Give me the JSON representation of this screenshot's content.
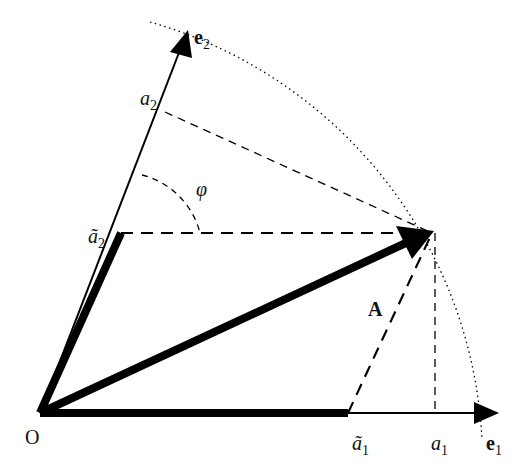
{
  "diagram": {
    "origin_label": "O",
    "vector_label": "A",
    "basis": {
      "e1": {
        "label": "e",
        "sub": "1"
      },
      "e2": {
        "label": "e",
        "sub": "2"
      }
    },
    "components": {
      "a1": {
        "label": "a",
        "sub": "1"
      },
      "a2": {
        "label": "a",
        "sub": "2"
      },
      "a1_tilde": {
        "label": "ã",
        "sub": "1"
      },
      "a2_tilde": {
        "label": "ã",
        "sub": "2"
      }
    },
    "angle_label": "φ",
    "colors": {
      "ink": "#000000",
      "background": "#ffffff"
    }
  }
}
